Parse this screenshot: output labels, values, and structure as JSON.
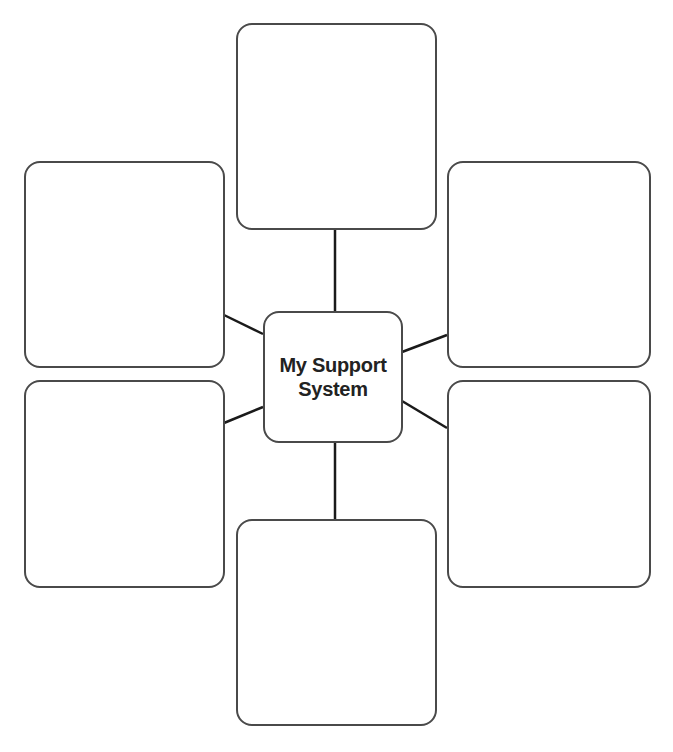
{
  "diagram": {
    "center": {
      "line1": "My Support",
      "line2": "System"
    },
    "colors": {
      "stroke": "#4a4a4a",
      "connector": "#1a1a1a",
      "text": "#222222",
      "background": "#ffffff"
    },
    "boxes": [
      {
        "id": "top",
        "label": ""
      },
      {
        "id": "left-upper",
        "label": ""
      },
      {
        "id": "right-upper",
        "label": ""
      },
      {
        "id": "left-lower",
        "label": ""
      },
      {
        "id": "right-lower",
        "label": ""
      },
      {
        "id": "bottom",
        "label": ""
      }
    ]
  }
}
